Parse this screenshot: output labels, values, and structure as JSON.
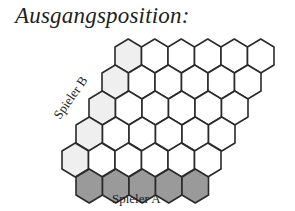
{
  "title": "Ausgangsposition:",
  "labels": {
    "player_a": "Spieler A",
    "player_b": "Spieler B"
  },
  "board": {
    "hex_width": 26.5,
    "row_step": 26,
    "top_y": 39,
    "rows": [
      {
        "x_start": 115,
        "count": 6,
        "first_owner": "B"
      },
      {
        "x_start": 102,
        "count": 6,
        "first_owner": "B"
      },
      {
        "x_start": 89,
        "count": 6,
        "first_owner": "B"
      },
      {
        "x_start": 76,
        "count": 6,
        "first_owner": "B"
      },
      {
        "x_start": 62,
        "count": 6,
        "first_owner": "B"
      },
      {
        "x_start": 76,
        "count": 5,
        "owner": "A"
      }
    ]
  },
  "colors": {
    "empty": "#ffffff",
    "player_b": "#efefef",
    "player_a": "#9a9a9a",
    "stroke": "#2a2a2a"
  }
}
